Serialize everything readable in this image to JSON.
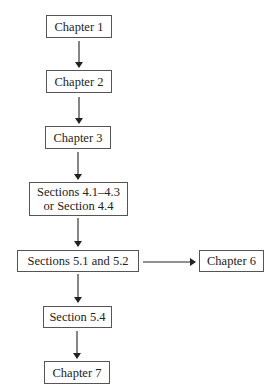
{
  "diagram": {
    "type": "flowchart",
    "nodes": [
      {
        "id": "ch1",
        "label": "Chapter 1"
      },
      {
        "id": "ch2",
        "label": "Chapter 2"
      },
      {
        "id": "ch3",
        "label": "Chapter 3"
      },
      {
        "id": "s4",
        "label_line1": "Sections 4.1–4.3",
        "label_line2": "or Section 4.4"
      },
      {
        "id": "s5",
        "label": "Sections 5.1 and 5.2"
      },
      {
        "id": "ch6",
        "label": "Chapter 6"
      },
      {
        "id": "s54",
        "label": "Section 5.4"
      },
      {
        "id": "ch7",
        "label": "Chapter 7"
      }
    ],
    "edges": [
      {
        "from": "ch1",
        "to": "ch2"
      },
      {
        "from": "ch2",
        "to": "ch3"
      },
      {
        "from": "ch3",
        "to": "s4"
      },
      {
        "from": "s4",
        "to": "s5"
      },
      {
        "from": "s5",
        "to": "ch6"
      },
      {
        "from": "s5",
        "to": "s54"
      },
      {
        "from": "s54",
        "to": "ch7"
      }
    ]
  }
}
